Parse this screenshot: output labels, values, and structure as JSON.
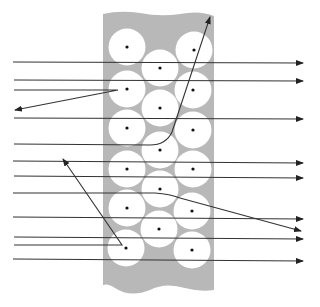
{
  "diagram": {
    "title": "",
    "colors": {
      "background": "#ffffff",
      "matrix": "#b8b8b8",
      "fiber": "#ffffff",
      "fiber_center": "#111111",
      "ray": "#333333"
    },
    "fiber_radius": 18.5,
    "fibers": [
      {
        "cx": 127,
        "cy": 47
      },
      {
        "cx": 127,
        "cy": 89
      },
      {
        "cx": 127,
        "cy": 128
      },
      {
        "cx": 127,
        "cy": 169
      },
      {
        "cx": 127,
        "cy": 208
      },
      {
        "cx": 126,
        "cy": 248
      },
      {
        "cx": 160,
        "cy": 68
      },
      {
        "cx": 160,
        "cy": 108
      },
      {
        "cx": 160,
        "cy": 150
      },
      {
        "cx": 160,
        "cy": 189
      },
      {
        "cx": 159,
        "cy": 229
      },
      {
        "cx": 194,
        "cy": 50
      },
      {
        "cx": 193,
        "cy": 90
      },
      {
        "cx": 193,
        "cy": 130
      },
      {
        "cx": 193,
        "cy": 169
      },
      {
        "cx": 192,
        "cy": 211
      },
      {
        "cx": 192,
        "cy": 250
      }
    ],
    "rays": [
      {
        "id": "ray-1",
        "type": "transmitted",
        "path": "M13,62 L303,63"
      },
      {
        "id": "ray-2",
        "type": "transmitted",
        "path": "M14,80 L303,81"
      },
      {
        "id": "ray-3",
        "type": "reflected-back",
        "path": "M14,90 L118,90 L15,110"
      },
      {
        "id": "ray-4",
        "type": "transmitted",
        "path": "M14,118 L303,119"
      },
      {
        "id": "ray-5",
        "type": "guided-up",
        "path": "M14,144 L150,145 Q166,145 172,132 L210,17"
      },
      {
        "id": "ray-6",
        "type": "transmitted",
        "path": "M13,161 L303,163"
      },
      {
        "id": "ray-7",
        "type": "transmitted",
        "path": "M14,176 L303,178"
      },
      {
        "id": "ray-8",
        "type": "scattered-down",
        "path": "M13,193 L155,193 Q170,194 180,198 L301,231"
      },
      {
        "id": "ray-9",
        "type": "transmitted",
        "path": "M13,217 L303,219"
      },
      {
        "id": "ray-10",
        "type": "transmitted",
        "path": "M14,237 L303,239"
      },
      {
        "id": "ray-11",
        "type": "reflected-up",
        "path": "M14,245 L122,245 L63,159"
      },
      {
        "id": "ray-12",
        "type": "transmitted",
        "path": "M13,259 L303,261"
      }
    ]
  }
}
